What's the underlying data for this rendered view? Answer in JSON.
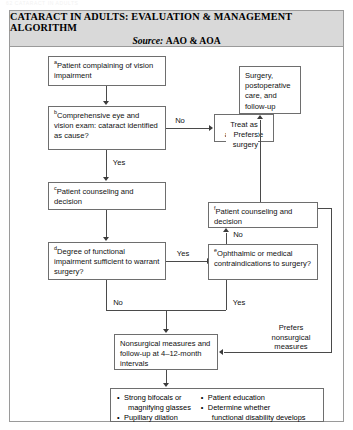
{
  "page": {
    "cutoff_header": "62   CATARACT IN ADULTS"
  },
  "figure": {
    "title_line1": "CATARACT IN ADULTS: EVALUATION & MANAGEMENT ALGORITHM",
    "source_label": "Source:",
    "source_value": "AAO & AOA"
  },
  "nodes": {
    "a": {
      "sup": "a",
      "text": "Patient complaining of vision impairment"
    },
    "b": {
      "sup": "b",
      "text": "Comprehensive eye and vision exam: cataract identified as cause?"
    },
    "treat": {
      "sup": "",
      "text": "Treat as appropriate"
    },
    "surgery": {
      "sup": "",
      "text": "Surgery, postoperative care, and follow-up"
    },
    "c": {
      "sup": "c",
      "text": "Patient counseling and decision"
    },
    "f": {
      "sup": "f",
      "text": "Patient counseling and decision"
    },
    "d": {
      "sup": "d",
      "text": "Degree of functional impairment sufficient to warrant surgery?"
    },
    "e": {
      "sup": "e",
      "text": "Ophthalmic or medical contraindications to surgery?"
    },
    "nonsurgical": {
      "sup": "",
      "text": "Nonsurgical measures and follow-up at 4–12-month intervals"
    }
  },
  "edge_labels": {
    "b_no": "No",
    "b_yes": "Yes",
    "d_yes": "Yes",
    "d_no": "No",
    "e_no": "No",
    "e_yes": "Yes",
    "prefers_surgery": "Prefers\nsurgery",
    "prefers_surgery_l1": "Prefers",
    "prefers_surgery_l2": "surgery",
    "prefers_nonsurgical_l1": "Prefers",
    "prefers_nonsurgical_l2": "nonsurgical",
    "prefers_nonsurgical_l3": "measures"
  },
  "bullets": {
    "left": [
      {
        "text": "Strong bifocals or",
        "cont": "magnifying glasses"
      },
      {
        "text": "Pupillary dilation",
        "cont": ""
      }
    ],
    "right": [
      {
        "text": "Patient education",
        "cont": ""
      },
      {
        "text": "Determine whether",
        "cont": "functional disability develops"
      }
    ]
  },
  "colors": {
    "title_band": "#d9d9d9",
    "border": "#9a9a9a",
    "node_border": "#6e6e6e",
    "line": "#4a4a4a"
  }
}
